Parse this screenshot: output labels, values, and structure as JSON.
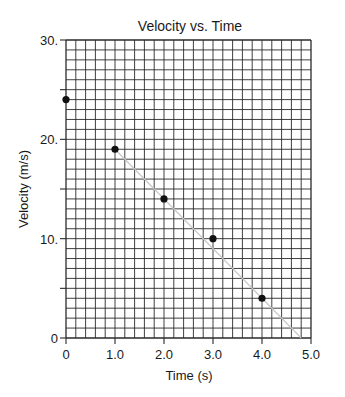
{
  "chart_data": {
    "type": "scatter",
    "title": "Velocity vs. Time",
    "xlabel": "Time (s)",
    "ylabel": "Velocity (m/s)",
    "xlim": [
      0,
      5.0
    ],
    "ylim": [
      0,
      30
    ],
    "x_tick_labels": [
      "0",
      "1.0",
      "2.0",
      "3.0",
      "4.0",
      "5.0"
    ],
    "x_ticks": [
      0,
      1,
      2,
      3,
      4,
      5
    ],
    "y_tick_labels": [
      "0",
      "10.",
      "20.",
      "30."
    ],
    "y_ticks": [
      0,
      10,
      20,
      30
    ],
    "y_minor_ticks": [
      5,
      15,
      25
    ],
    "grid": true,
    "grid_columns": 25,
    "grid_rows": 30,
    "series": [
      {
        "name": "Measured velocity",
        "x": [
          0,
          1.0,
          2.0,
          3.0,
          4.0
        ],
        "y": [
          24,
          19,
          14,
          10,
          4
        ]
      }
    ],
    "best_fit_line": {
      "x": [
        1.0,
        4.8
      ],
      "y": [
        19,
        0
      ]
    },
    "legend": null
  },
  "colors": {
    "grid": "#2a2a2a",
    "point": "#111111",
    "fit_line": "#c8c8c8",
    "text": "#1a1a1a"
  }
}
